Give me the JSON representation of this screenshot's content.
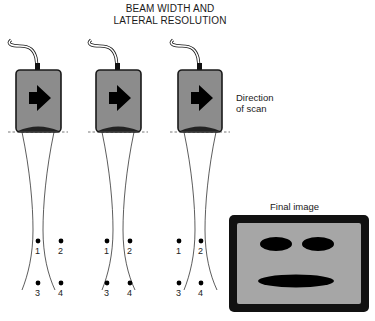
{
  "title": {
    "line1": "BEAM WIDTH AND",
    "line2": "LATERAL RESOLUTION"
  },
  "direction_label": {
    "line1": "Direction",
    "line2": "of scan"
  },
  "final_image": {
    "label": "Final image",
    "frame_color": "#111111",
    "screen_color": "#a6a6a6",
    "features": [
      "left-eye",
      "right-eye",
      "mouth"
    ]
  },
  "colors": {
    "transducer_body": "#8c8c8c",
    "transducer_outline": "#1a1a1a",
    "arrow": "#000000",
    "beam_line": "#333333",
    "dashed_line": "#555555"
  },
  "transducers": [
    {
      "id": 1,
      "icon": "arrow-right-icon",
      "reflectors": [
        "1",
        "2",
        "3",
        "4"
      ]
    },
    {
      "id": 2,
      "icon": "arrow-right-icon",
      "reflectors": [
        "1",
        "2",
        "3",
        "4"
      ]
    },
    {
      "id": 3,
      "icon": "arrow-right-icon",
      "reflectors": [
        "1",
        "2",
        "3",
        "4"
      ]
    }
  ]
}
